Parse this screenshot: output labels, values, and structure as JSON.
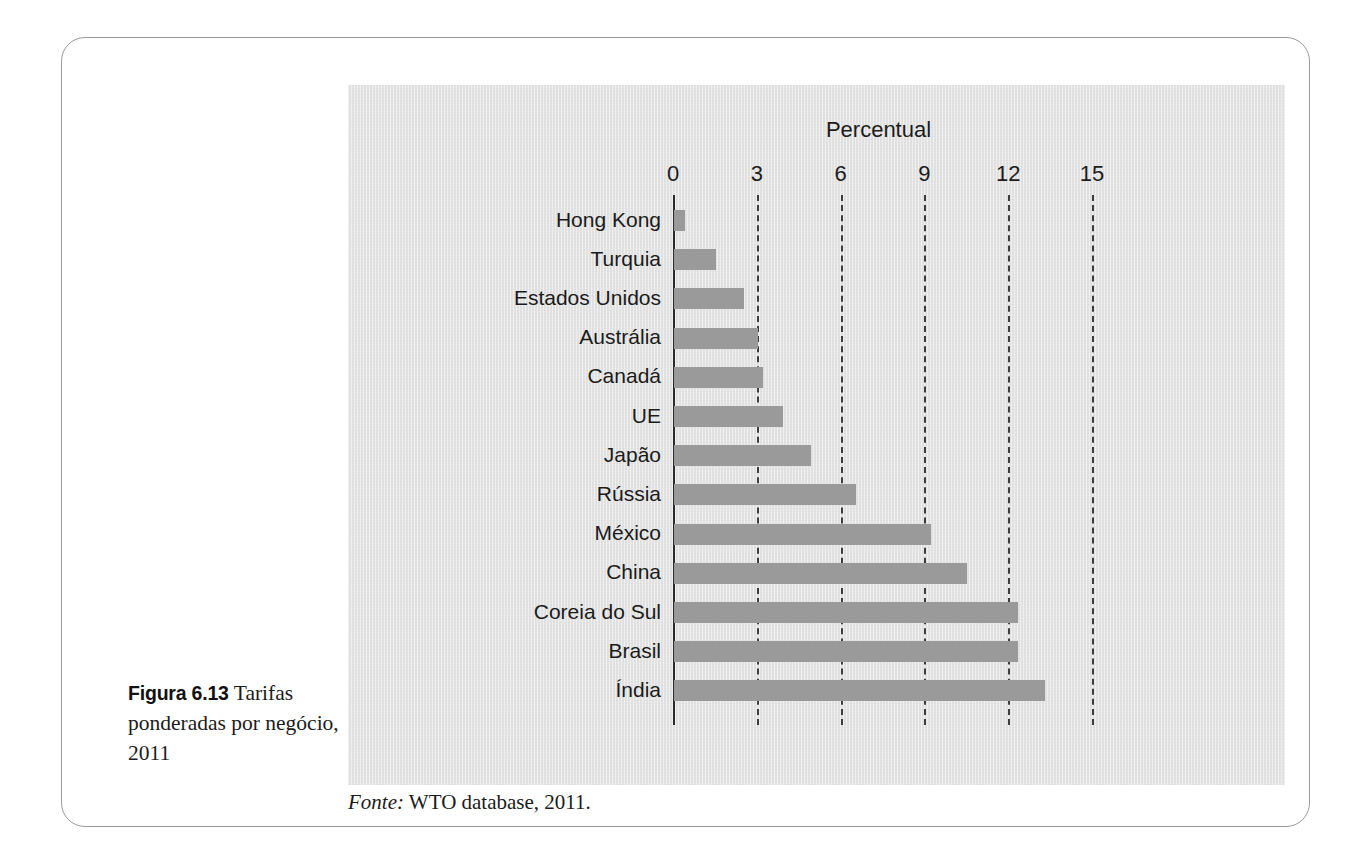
{
  "figure": {
    "label": "Figura 6.13",
    "caption": "Tarifas ponderadas por negócio, 2011",
    "source_lead": "Fonte:",
    "source_text": "WTO database, 2011."
  },
  "colors": {
    "panel_background": "#e2e2e2",
    "bar_fill": "#9a9a9a",
    "axis_line": "#2b2b2b",
    "gridline": "#3d3d3d",
    "text": "#1b1b1b",
    "frame_border": "#9b9b9b"
  },
  "chart_data": {
    "type": "bar",
    "orientation": "horizontal",
    "title": "",
    "xlabel": "Percentual",
    "ylabel": "",
    "xlim": [
      0,
      16.5
    ],
    "xticks": [
      0,
      3,
      6,
      9,
      12,
      15
    ],
    "xtick_labels": [
      "0",
      "3",
      "6",
      "9",
      "12",
      "15"
    ],
    "grid": "vertical dashed at 3, 6, 9, 12, 15; solid axis at 0",
    "legend": "none",
    "categories": [
      "Hong Kong",
      "Turquia",
      "Estados Unidos",
      "Austrália",
      "Canadá",
      "UE",
      "Japão",
      "Rússia",
      "México",
      "China",
      "Coreia do Sul",
      "Brasil",
      "Índia"
    ],
    "values": [
      0.4,
      1.5,
      2.5,
      3.0,
      3.2,
      3.9,
      4.9,
      6.5,
      9.2,
      10.5,
      12.3,
      12.3,
      13.3
    ]
  }
}
